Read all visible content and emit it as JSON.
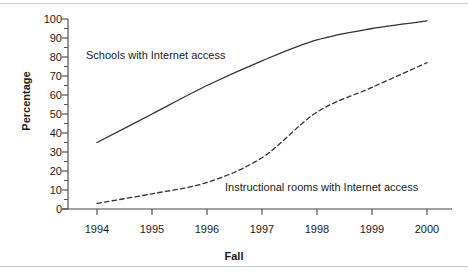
{
  "chart_data": {
    "type": "line",
    "title": "",
    "subtitle": "",
    "xlabel": "Fall",
    "ylabel": "Percentage",
    "x": [
      1994,
      1995,
      1996,
      1997,
      1998,
      1999,
      2000
    ],
    "xtick_labels": [
      "1994",
      "1995",
      "1996",
      "1997",
      "1998",
      "1999",
      "2000"
    ],
    "ytick_labels": [
      "0",
      "10",
      "20",
      "30",
      "40",
      "50",
      "60",
      "70",
      "80",
      "90",
      "100"
    ],
    "ytick_values": [
      0,
      10,
      20,
      30,
      40,
      50,
      60,
      70,
      80,
      90,
      100
    ],
    "ylim": [
      0,
      100
    ],
    "xlim": [
      1994,
      2000
    ],
    "y_minor_tick_step": 5,
    "grid": false,
    "legend_position": "inline-annotations",
    "series": [
      {
        "name": "Schools with Internet access",
        "style": "solid",
        "color": "#333333",
        "values": [
          35,
          50,
          65,
          78,
          89,
          95,
          99
        ]
      },
      {
        "name": "Instructional rooms with Internet access",
        "style": "dashed",
        "color": "#333333",
        "values": [
          3,
          8,
          14,
          27,
          51,
          64,
          77
        ]
      }
    ],
    "annotations": [
      {
        "text": "Schools with Internet access",
        "x": 1994.6,
        "y": 84
      },
      {
        "text": "Instructional rooms with Internet access",
        "x": 1996.5,
        "y": 14
      }
    ]
  },
  "colors": {
    "axis": "#444444",
    "text": "#1a1a1a",
    "line": "#333333",
    "scanline": "#c9c9c9",
    "background": "#ffffff"
  }
}
